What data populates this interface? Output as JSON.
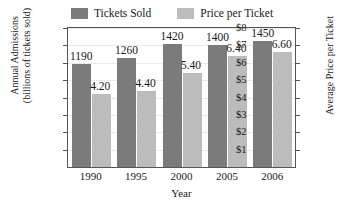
{
  "chart_data": {
    "type": "bar",
    "title": "",
    "categories": [
      "1990",
      "1995",
      "2000",
      "2005",
      "2006"
    ],
    "series": [
      {
        "name": "Tickets Sold",
        "axis": "left",
        "color": "#7b7b7b",
        "values": [
          1190,
          1260,
          1420,
          1400,
          1450
        ],
        "labels": [
          "1190",
          "1260",
          "1420",
          "1400",
          "1450"
        ]
      },
      {
        "name": "Price per Ticket",
        "axis": "right",
        "color": "#bcbcbc",
        "values": [
          4.2,
          4.4,
          5.4,
          6.4,
          6.6
        ],
        "labels": [
          "4.20",
          "4.40",
          "5.40",
          "6.40",
          "6.60"
        ]
      }
    ],
    "xlabel": "Year",
    "ylabel_left_line1": "Annual Admissions",
    "ylabel_left_line2": "(billions of tickets sold)",
    "ylabel_right": "Average Price per Ticket",
    "ylim_left": [
      0,
      1600
    ],
    "ylim_right": [
      0,
      8
    ],
    "yticks_left": [
      1600,
      1400,
      1200,
      1000,
      800,
      600,
      400,
      200
    ],
    "yticks_left_labels": [
      "1600",
      "1400",
      "1200",
      "1000",
      "800",
      "600",
      "400",
      "200"
    ],
    "yticks_right": [
      8,
      7,
      6,
      5,
      4,
      3,
      2,
      1
    ],
    "yticks_right_labels": [
      "$8",
      "$7",
      "$6",
      "$5",
      "$4",
      "$3",
      "$2",
      "$1"
    ],
    "grid": true,
    "legend_position": "top-center"
  },
  "legend": {
    "entries": [
      {
        "label": "Tickets Sold",
        "color": "#7b7b7b"
      },
      {
        "label": "Price per Ticket",
        "color": "#bcbcbc"
      }
    ]
  }
}
